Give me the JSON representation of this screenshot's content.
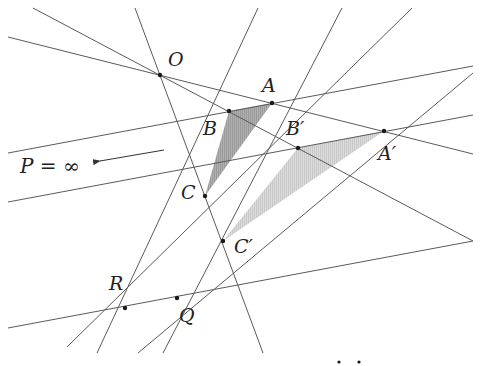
{
  "figure": {
    "colors": {
      "line": "#5a5a5a",
      "point": "#1a1a1a",
      "triangle_dark": "#a6a6a6",
      "triangle_light": "#d4d4d4"
    },
    "labels": {
      "O": "O",
      "A": "A",
      "B": "B",
      "C": "C",
      "A_prime": "A′",
      "B_prime": "B′",
      "C_prime": "C′",
      "R": "R",
      "Q": "Q",
      "P": "P = ∞"
    },
    "points": {
      "O": [
        160,
        75
      ],
      "A": [
        272,
        103
      ],
      "B": [
        229,
        111
      ],
      "C": [
        205,
        196
      ],
      "A_prime": [
        384,
        131
      ],
      "B_prime": [
        298,
        148
      ],
      "C_prime": [
        223,
        241
      ],
      "R": [
        125,
        308
      ],
      "Q": [
        177,
        298
      ]
    },
    "triangles": [
      {
        "name": "ABC",
        "vertices": [
          "A",
          "B",
          "C"
        ],
        "shade": "dark"
      },
      {
        "name": "A'B'C'",
        "vertices": [
          "A_prime",
          "B_prime",
          "C_prime"
        ],
        "shade": "light"
      }
    ],
    "lines": [
      {
        "name": "OAA'",
        "from": [
          8,
          37
        ],
        "to": [
          473,
          154
        ]
      },
      {
        "name": "OBB'",
        "from": [
          33,
          8
        ],
        "to": [
          473,
          241
        ]
      },
      {
        "name": "OCC'",
        "from": [
          135,
          8
        ],
        "to": [
          263,
          353
        ]
      },
      {
        "name": "AB-parallel",
        "from": [
          8,
          153
        ],
        "to": [
          473,
          66
        ]
      },
      {
        "name": "A'B'-parallel",
        "from": [
          8,
          202
        ],
        "to": [
          473,
          115
        ]
      },
      {
        "name": "BC",
        "from": [
          258,
          8
        ],
        "to": [
          97,
          353
        ]
      },
      {
        "name": "AC",
        "from": [
          342,
          8
        ],
        "to": [
          163,
          353
        ]
      },
      {
        "name": "B'C'",
        "from": [
          412,
          8
        ],
        "to": [
          67,
          347
        ]
      },
      {
        "name": "A'C'",
        "from": [
          473,
          73
        ],
        "to": [
          138,
          353
        ]
      },
      {
        "name": "RQ",
        "from": [
          8,
          328
        ],
        "to": [
          473,
          241
        ]
      }
    ],
    "arrow": {
      "from": [
        164,
        150
      ],
      "to": [
        95,
        162
      ]
    },
    "stray_dots": [
      [
        339,
        362
      ],
      [
        359,
        362
      ]
    ]
  }
}
